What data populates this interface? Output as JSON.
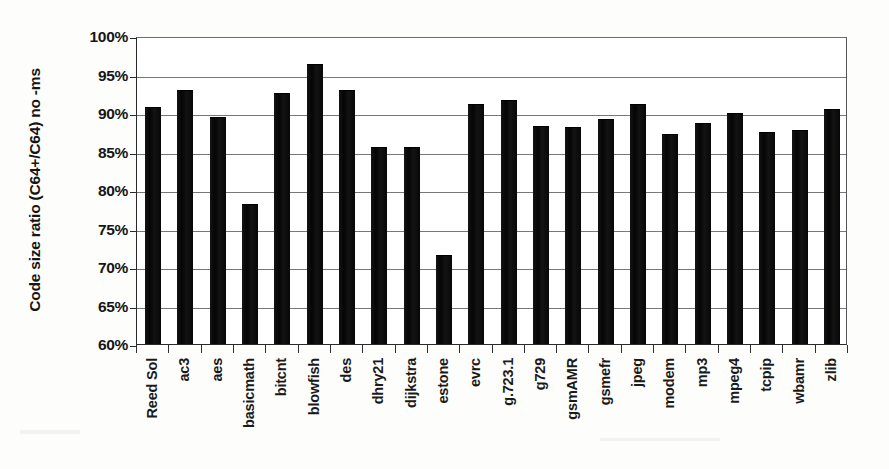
{
  "chart_data": {
    "type": "bar",
    "title": "",
    "xlabel": "",
    "ylabel": "Code size ratio (C64+/C64) no -ms",
    "ylim": [
      60,
      100
    ],
    "ytick_step": 5,
    "ytick_labels": [
      "100%",
      "95%",
      "90%",
      "85%",
      "80%",
      "75%",
      "70%",
      "65%",
      "60%"
    ],
    "ytick_values": [
      100,
      95,
      90,
      85,
      80,
      75,
      70,
      65,
      60
    ],
    "grid": true,
    "legend": "none",
    "bar_color": "#0d0d0d",
    "value_unit": "percent",
    "categories": [
      "Reed Sol",
      "ac3",
      "aes",
      "basicmath",
      "bitcnt",
      "blowfish",
      "des",
      "dhry21",
      "dijkstra",
      "estone",
      "evrc",
      "g.723.1",
      "g729",
      "gsmAMR",
      "gsmefr",
      "jpeg",
      "modem",
      "mp3",
      "mpeg4",
      "tcpip",
      "wbamr",
      "zlib"
    ],
    "values": [
      90.7,
      92.8,
      89.3,
      78.0,
      92.5,
      96.3,
      92.9,
      85.5,
      85.4,
      71.4,
      91.1,
      91.6,
      88.2,
      88.0,
      89.1,
      91.1,
      87.1,
      88.6,
      89.9,
      87.4,
      87.7,
      90.4
    ]
  }
}
